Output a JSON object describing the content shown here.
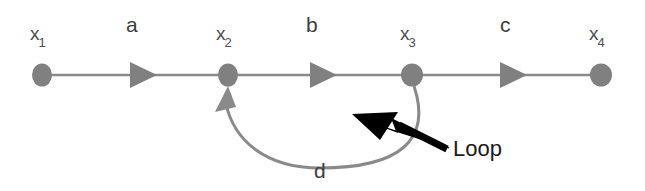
{
  "diagram": {
    "type": "signal-flow-graph",
    "title": "",
    "canvas": {
      "width": 645,
      "height": 191,
      "background": "#ffffff"
    },
    "colors": {
      "node": "#808080",
      "edge": "#8a8a8a",
      "edge_label": "#3d3d3d",
      "node_label": "#4d4d4d",
      "annotation": "#1a1a1a",
      "background": "#ffffff"
    },
    "nodes": [
      {
        "id": "x1",
        "base": "x",
        "subscript": "1",
        "label": "x1",
        "cx": 42,
        "cy": 75,
        "rx": 10,
        "ry": 11,
        "label_x": 30,
        "label_y": 24
      },
      {
        "id": "x2",
        "base": "x",
        "subscript": "2",
        "label": "x2",
        "cx": 228,
        "cy": 75,
        "rx": 10,
        "ry": 11,
        "label_x": 216,
        "label_y": 24
      },
      {
        "id": "x3",
        "base": "x",
        "subscript": "3",
        "label": "x3",
        "cx": 412,
        "cy": 75,
        "rx": 11,
        "ry": 11,
        "label_x": 400,
        "label_y": 24
      },
      {
        "id": "x4",
        "base": "x",
        "subscript": "4",
        "label": "x4",
        "cx": 601,
        "cy": 75,
        "rx": 11,
        "ry": 11,
        "label_x": 589,
        "label_y": 24
      }
    ],
    "edges": [
      {
        "id": "a",
        "label": "a",
        "from": "x1",
        "to": "x2",
        "kind": "straight",
        "label_x": 126,
        "label_y": 14,
        "arrow_x": 142,
        "arrow_y": 75
      },
      {
        "id": "b",
        "label": "b",
        "from": "x2",
        "to": "x3",
        "kind": "straight",
        "label_x": 306,
        "label_y": 14,
        "arrow_x": 322,
        "arrow_y": 75
      },
      {
        "id": "c",
        "label": "c",
        "from": "x3",
        "to": "x4",
        "kind": "straight",
        "label_x": 500,
        "label_y": 14,
        "arrow_x": 512,
        "arrow_y": 75
      },
      {
        "id": "d",
        "label": "d",
        "from": "x3",
        "to": "x2",
        "kind": "curved-loop",
        "label_x": 314,
        "label_y": 160
      }
    ],
    "annotations": [
      {
        "id": "loop",
        "text": "Loop",
        "points_to": "d",
        "label_x": 453,
        "label_y": 138,
        "arrow_color": "#000000"
      }
    ]
  }
}
